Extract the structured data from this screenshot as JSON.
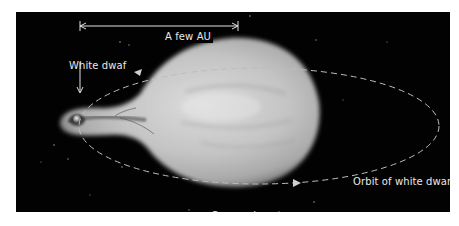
{
  "diagram": {
    "labels": {
      "scale_bar": "A few AU",
      "white_dwarf": "White dwaf",
      "orbit": "Orbit of white dwarf",
      "companion": "Companion star"
    },
    "colors": {
      "background": "#020202",
      "page": "#ffffff",
      "star_core": "#d8d8d8",
      "star_edge": "#7a7a7a",
      "label_text": "#e8e8e8",
      "orbit_dash": "#bdbdbd"
    },
    "elements": [
      {
        "name": "companion-star",
        "shape": "teardrop",
        "description": "Large gray giant star distorted into a teardrop toward the white dwarf"
      },
      {
        "name": "white-dwarf",
        "shape": "small sphere",
        "description": "Compact object at tip of accretion stream"
      },
      {
        "name": "orbit",
        "shape": "dashed ellipse",
        "description": "Orbit of white dwarf around companion, with arrowheads"
      },
      {
        "name": "scale-bar",
        "shape": "double-headed arrow",
        "description": "Scale indicator spanning a few AU"
      }
    ]
  }
}
